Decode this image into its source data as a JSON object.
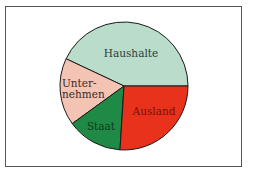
{
  "chart_data": {
    "type": "pie",
    "title": "",
    "categories": [
      "Haushalte",
      "Unternehmen",
      "Staat",
      "Ausland"
    ],
    "values": [
      43,
      17,
      14,
      26
    ],
    "unit": "percent (estimated from slice angles)",
    "start_angle_deg": 0,
    "direction": "counterclockwise",
    "colors": {
      "Haushalte": "#b9dccb",
      "Unternehmen": "#f3c3b4",
      "Staat": "#1f8a45",
      "Ausland": "#e8321c"
    },
    "label_colors": {
      "Haushalte": "#2a3a33",
      "Unternehmen": "#3a2a26",
      "Staat": "#0d3a1c",
      "Ausland": "#7a1008"
    },
    "legend": "none (labels inside slices)"
  },
  "labels": {
    "haushalte": "Haushalte",
    "unternehmen_line1": "Unter-",
    "unternehmen_line2": "nehmen",
    "staat": "Staat",
    "ausland": "Ausland"
  }
}
